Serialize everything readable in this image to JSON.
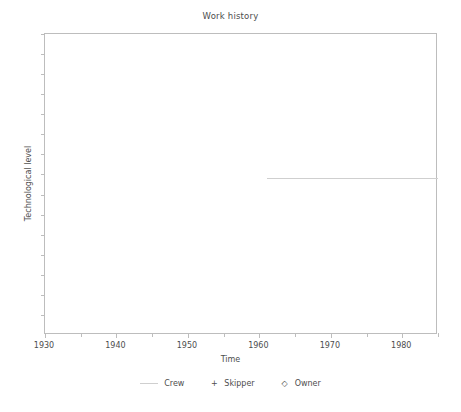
{
  "chart_data": {
    "type": "line",
    "title": "Work history",
    "xlabel": "Time",
    "ylabel": "Technological level",
    "xlim": [
      1930,
      1985
    ],
    "ylim": [
      0,
      15
    ],
    "grid": false,
    "legend_position": "bottom",
    "x_tick_labels": [
      "1930",
      "1940",
      "1950",
      "1960",
      "1970",
      "1980"
    ],
    "x_major_ticks": [
      1930,
      1940,
      1950,
      1960,
      1970,
      1980
    ],
    "x_minor_ticks": [
      1935,
      1945,
      1955,
      1965,
      1975,
      1985
    ],
    "y_tick_labels": [],
    "y_ticks": [
      1,
      2,
      3,
      4,
      5,
      6,
      7,
      8,
      9,
      10,
      11,
      12,
      13,
      14,
      15
    ],
    "series": [
      {
        "name": "Crew",
        "marker": "line",
        "color": "#cfcfcf",
        "x": [
          1961,
          1985
        ],
        "values": [
          7.8,
          7.8
        ]
      },
      {
        "name": "Skipper",
        "marker": "+",
        "color": "#4d4d4d",
        "x": [],
        "values": []
      },
      {
        "name": "Owner",
        "marker": "diamond",
        "color": "#4d4d4d",
        "x": [],
        "values": []
      }
    ]
  },
  "legend": {
    "entries": [
      {
        "label": "Crew",
        "glyph": ""
      },
      {
        "label": "Skipper",
        "glyph": "+"
      },
      {
        "label": "Owner",
        "glyph": "◇"
      }
    ]
  },
  "colors": {
    "axis": "#bdbdbd",
    "text": "#4d4d4d",
    "series_crew": "#cfcfcf",
    "background": "#ffffff"
  }
}
